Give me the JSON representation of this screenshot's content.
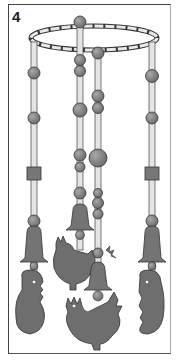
{
  "figure": {
    "number": "4",
    "colors": {
      "background": "#ffffff",
      "frame": "#444444",
      "bead": "#7a7a7a",
      "shape": "#6e6e6e",
      "rod": "#e4e4e4",
      "outline": "#333333"
    },
    "strands": [
      {
        "position": "left",
        "ornaments": [
          "bead",
          "bead",
          "square-bead",
          "bead",
          "bell",
          "bear-figure"
        ]
      },
      {
        "position": "center-left",
        "ornaments": [
          "bead",
          "bead",
          "bead",
          "bead",
          "bead",
          "bead",
          "bell",
          "bead",
          "rooster-figure"
        ]
      },
      {
        "position": "center-right",
        "ornaments": [
          "bead",
          "bead",
          "bead",
          "large-bead",
          "bead",
          "bead",
          "bead",
          "bead",
          "bell",
          "bead",
          "rooster-figure"
        ]
      },
      {
        "position": "right",
        "ornaments": [
          "bead",
          "bead",
          "square-bead",
          "bead",
          "bell",
          "bear-figure"
        ]
      }
    ]
  }
}
